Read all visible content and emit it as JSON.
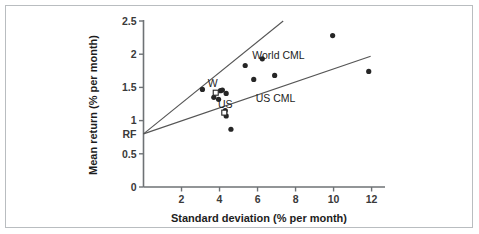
{
  "figure": {
    "border_color": "#b9bdc0",
    "background": "#ffffff"
  },
  "chart_data": {
    "type": "scatter",
    "title": "",
    "xlabel": "Standard deviation (% per month)",
    "ylabel": "Mean return (% per month)",
    "xlim": [
      0,
      12.6
    ],
    "ylim": [
      0,
      2.5
    ],
    "xticks": [
      2,
      4,
      6,
      8,
      10,
      12
    ],
    "xtick_labels": [
      "2",
      "4",
      "6",
      "8",
      "10",
      "12"
    ],
    "yticks": [
      0,
      0.5,
      1,
      1.5,
      2,
      2.5
    ],
    "ytick_labels": [
      "0",
      "0.5",
      "1",
      "1.5",
      "2",
      "2.5"
    ],
    "grid": false,
    "legend_position": "inline-annotations",
    "marker_color": "#262626",
    "line_color": "#555555",
    "series": [
      {
        "name": "Country portfolios",
        "marker": "filled-circle",
        "points": [
          {
            "x": 3.1,
            "y": 1.47
          },
          {
            "x": 3.7,
            "y": 1.35
          },
          {
            "x": 3.95,
            "y": 1.32
          },
          {
            "x": 4.05,
            "y": 1.45
          },
          {
            "x": 4.15,
            "y": 1.46
          },
          {
            "x": 4.35,
            "y": 1.41
          },
          {
            "x": 4.3,
            "y": 1.15
          },
          {
            "x": 4.35,
            "y": 1.07
          },
          {
            "x": 4.6,
            "y": 0.87
          },
          {
            "x": 5.35,
            "y": 1.83
          },
          {
            "x": 5.8,
            "y": 1.62
          },
          {
            "x": 6.25,
            "y": 1.93
          },
          {
            "x": 6.9,
            "y": 1.68
          },
          {
            "x": 9.95,
            "y": 2.28
          },
          {
            "x": 11.85,
            "y": 1.74
          }
        ]
      },
      {
        "name": "Benchmark portfolios",
        "marker": "open-square",
        "points": [
          {
            "x": 3.8,
            "y": 1.42,
            "label": "W"
          },
          {
            "x": 4.25,
            "y": 1.12,
            "label": "US"
          }
        ]
      }
    ],
    "lines": [
      {
        "name": "World CML",
        "label": "World CML",
        "from": {
          "x": 0.0,
          "y": 0.8
        },
        "to": {
          "x": 7.35,
          "y": 2.5
        },
        "label_at": {
          "x": 7.1,
          "y": 1.93
        }
      },
      {
        "name": "US CML",
        "label": "US CML",
        "from": {
          "x": 0.0,
          "y": 0.8
        },
        "to": {
          "x": 11.95,
          "y": 1.97
        },
        "label_at": {
          "x": 6.95,
          "y": 1.28
        }
      }
    ],
    "annotations": [
      {
        "name": "risk-free-rate",
        "text": "RF",
        "x": 0.0,
        "y": 0.8
      }
    ]
  }
}
